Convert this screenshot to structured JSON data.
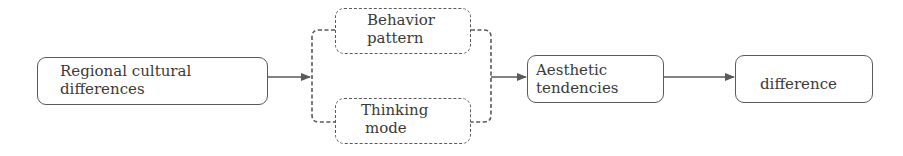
{
  "diagram": {
    "type": "flowchart",
    "nodes": [
      {
        "id": "regional",
        "line1": "Regional cultural",
        "line2": "differences",
        "style": "solid"
      },
      {
        "id": "behavior",
        "line1": "Behavior",
        "line2": "pattern",
        "style": "dashed"
      },
      {
        "id": "thinking",
        "line1": "Thinking",
        "line2": "mode",
        "style": "dashed"
      },
      {
        "id": "aesthetic",
        "line1": "Aesthetic",
        "line2": "tendencies",
        "style": "solid"
      },
      {
        "id": "difference",
        "line1": "difference",
        "style": "solid"
      }
    ],
    "edges": [
      {
        "from": "regional",
        "to": "behavior+thinking group"
      },
      {
        "from": "behavior+thinking group",
        "to": "aesthetic"
      },
      {
        "from": "aesthetic",
        "to": "difference"
      }
    ],
    "colors": {
      "stroke": "#5a5a5a",
      "text": "#3a3a3a",
      "background": "#ffffff"
    }
  }
}
